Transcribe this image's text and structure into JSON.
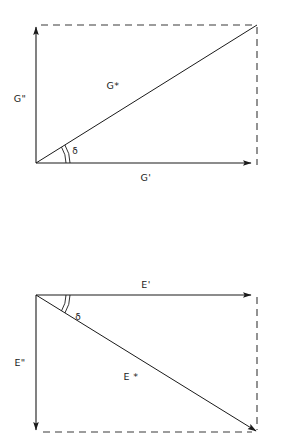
{
  "figure": {
    "background_color": "#ffffff",
    "line_color": "#1a1a1a",
    "dashed_color": "#3a3a3a"
  },
  "diagrams": [
    {
      "id": "shear-modulus-diagram",
      "name": "Complex shear modulus G*",
      "orientation": "imaginary-axis-up",
      "origin": {
        "x": 36,
        "y": 163
      },
      "corner": {
        "x": 257,
        "y": 25
      },
      "real_axis": {
        "label": "G'",
        "label_x": 146,
        "label_y": 179,
        "from": {
          "x": 36,
          "y": 163
        },
        "to": {
          "x": 251,
          "y": 163
        },
        "arrow": "right"
      },
      "imag_axis": {
        "label": "G\"",
        "label_x": 20,
        "label_y": 102,
        "from": {
          "x": 36,
          "y": 163
        },
        "to": {
          "x": 36,
          "y": 27
        },
        "arrow": "up"
      },
      "resultant": {
        "label": "G*",
        "label_x": 113,
        "label_y": 89,
        "from": {
          "x": 36,
          "y": 163
        },
        "to": {
          "x": 257,
          "y": 25
        },
        "arrow": "none"
      },
      "angle": {
        "label": "δ",
        "label_x": 72,
        "label_y": 153,
        "arc_radius_inner": 30,
        "arc_radius_outer": 34,
        "start_deg": 0,
        "end_deg": 32
      },
      "dashed": [
        {
          "from": {
            "x": 41,
            "y": 25
          },
          "to": {
            "x": 257,
            "y": 25
          }
        },
        {
          "from": {
            "x": 257,
            "y": 27
          },
          "to": {
            "x": 257,
            "y": 165
          }
        }
      ]
    },
    {
      "id": "tensile-modulus-diagram",
      "name": "Complex tensile modulus E*",
      "orientation": "imaginary-axis-down",
      "origin": {
        "x": 36,
        "y": 295
      },
      "corner": {
        "x": 257,
        "y": 432
      },
      "real_axis": {
        "label": "E'",
        "label_x": 146,
        "label_y": 288,
        "from": {
          "x": 36,
          "y": 295
        },
        "to": {
          "x": 251,
          "y": 295
        },
        "arrow": "right"
      },
      "imag_axis": {
        "label": "E\"",
        "label_x": 20,
        "label_y": 363,
        "from": {
          "x": 36,
          "y": 295
        },
        "to": {
          "x": 36,
          "y": 430
        },
        "arrow": "down"
      },
      "resultant": {
        "label": "E *",
        "label_x": 128,
        "label_y": 380,
        "from": {
          "x": 36,
          "y": 295
        },
        "to": {
          "x": 258,
          "y": 433
        },
        "arrow": "end"
      },
      "angle": {
        "label": "δ",
        "label_x": 75,
        "label_y": 317,
        "arc_radius_inner": 30,
        "arc_radius_outer": 34,
        "start_deg": 0,
        "end_deg": 32
      },
      "dashed": [
        {
          "from": {
            "x": 43,
            "y": 432
          },
          "to": {
            "x": 257,
            "y": 432
          }
        },
        {
          "from": {
            "x": 257,
            "y": 297
          },
          "to": {
            "x": 257,
            "y": 430
          }
        }
      ]
    }
  ]
}
